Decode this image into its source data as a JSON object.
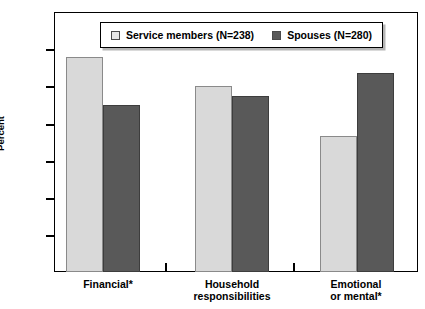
{
  "chart_data": {
    "type": "bar",
    "title": "",
    "xlabel": "",
    "ylabel": "Percent",
    "ylim": [
      0,
      70
    ],
    "yticks": [
      0,
      10,
      20,
      30,
      40,
      50,
      60,
      70
    ],
    "grid": false,
    "legend_position": "top-center",
    "categories": [
      "Financial*",
      "Household responsibilities",
      "Emotional or mental*"
    ],
    "category_lines": [
      [
        "Financial*"
      ],
      [
        "Household responsibilities"
      ],
      [
        "Emotional",
        "or mental*"
      ]
    ],
    "series": [
      {
        "name": "Service members (N=238)",
        "color": "#d9d9d9",
        "values": [
          58,
          50,
          36.5
        ]
      },
      {
        "name": "Spouses (N=280)",
        "color": "#595959",
        "values": [
          45,
          47.5,
          53.5
        ]
      }
    ],
    "footnote": ""
  },
  "axis": {
    "y_label": "Percent",
    "y_ticks": [
      "0",
      "10",
      "20",
      "30",
      "40",
      "50",
      "60",
      "70"
    ]
  },
  "legend": {
    "items": [
      {
        "label": "Service members (N=238)",
        "swatch": "light"
      },
      {
        "label": "Spouses (N=280)",
        "swatch": "dark"
      }
    ]
  }
}
